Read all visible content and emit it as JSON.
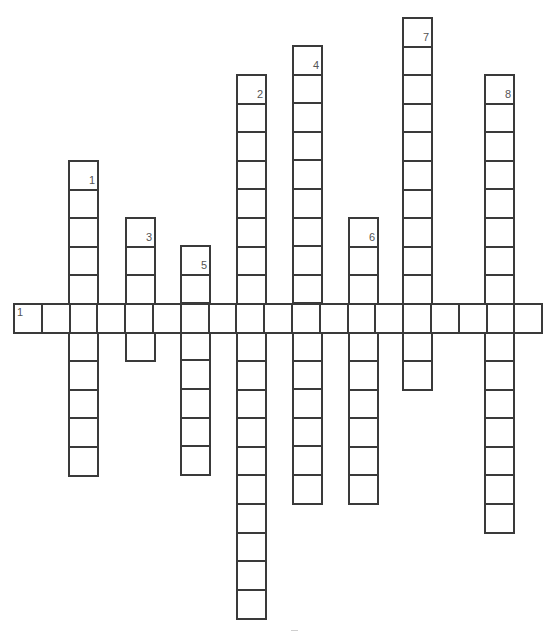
{
  "puzzle": {
    "type": "crossword",
    "cell_height": 28.6,
    "cell_width_across": 27.8,
    "border_color": "#3a3a3a",
    "number_color": "#555555"
  },
  "ghost_text_lines": [
    "",
    "",
    "",
    "",
    "",
    ""
  ],
  "across": [
    {
      "number": "1",
      "x": 13,
      "y": 303,
      "length": 19
    }
  ],
  "down": [
    {
      "number": "1",
      "x": 68,
      "y": 160,
      "length": 11
    },
    {
      "number": "2",
      "x": 236,
      "y": 74,
      "length": 19
    },
    {
      "number": "3",
      "x": 125,
      "y": 217,
      "length": 5
    },
    {
      "number": "4",
      "x": 292,
      "y": 45,
      "length": 16
    },
    {
      "number": "5",
      "x": 180,
      "y": 245,
      "length": 8
    },
    {
      "number": "6",
      "x": 348,
      "y": 217,
      "length": 10
    },
    {
      "number": "7",
      "x": 402,
      "y": 17,
      "length": 13
    },
    {
      "number": "8",
      "x": 484,
      "y": 74,
      "length": 16
    }
  ]
}
